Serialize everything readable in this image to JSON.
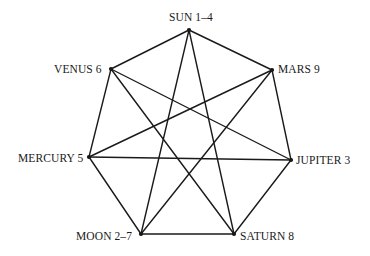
{
  "diagram": {
    "type": "heptagram",
    "line_color": "#1a1a1a",
    "vertices": [
      {
        "id": "sun",
        "label": "SUN 1–4",
        "x": 189,
        "y": 30
      },
      {
        "id": "mars",
        "label": "MARS 9",
        "x": 272,
        "y": 70
      },
      {
        "id": "jupiter",
        "label": "JUPITER 3",
        "x": 291,
        "y": 160
      },
      {
        "id": "saturn",
        "label": "SATURN 8",
        "x": 234,
        "y": 234
      },
      {
        "id": "moon",
        "label": "MOON 2–7",
        "x": 141,
        "y": 234
      },
      {
        "id": "mercury",
        "label": "MERCURY 5",
        "x": 89,
        "y": 157
      },
      {
        "id": "venus",
        "label": "VENUS 6",
        "x": 111,
        "y": 69
      }
    ],
    "heptagon_edges": [
      [
        "sun",
        "mars"
      ],
      [
        "mars",
        "jupiter"
      ],
      [
        "jupiter",
        "saturn"
      ],
      [
        "saturn",
        "moon"
      ],
      [
        "moon",
        "mercury"
      ],
      [
        "mercury",
        "venus"
      ],
      [
        "venus",
        "sun"
      ]
    ],
    "star_edges": [
      [
        "sun",
        "saturn"
      ],
      [
        "sun",
        "moon"
      ],
      [
        "mars",
        "moon"
      ],
      [
        "mars",
        "mercury"
      ],
      [
        "jupiter",
        "mercury"
      ],
      [
        "jupiter",
        "venus"
      ],
      [
        "saturn",
        "venus"
      ]
    ]
  }
}
